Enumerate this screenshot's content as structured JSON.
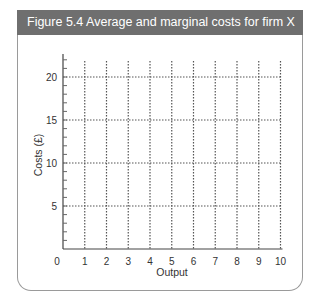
{
  "figure": {
    "title": "Figure 5.4  Average and marginal costs for firm X",
    "header_color": "#6f6f6f"
  },
  "chart_data": {
    "type": "line",
    "title": "Figure 5.4  Average and marginal costs for firm X",
    "xlabel": "Output",
    "ylabel": "Costs (£)",
    "x_ticks": [
      "0",
      "1",
      "2",
      "3",
      "4",
      "5",
      "6",
      "7",
      "8",
      "9",
      "10"
    ],
    "y_ticks": [
      "5",
      "10",
      "15",
      "20"
    ],
    "origin_label": "0",
    "xlim": [
      0,
      10
    ],
    "ylim": [
      0,
      22.5
    ],
    "grid": true,
    "grid_style": "dotted",
    "x_gridlines": [
      1,
      2,
      3,
      4,
      5,
      6,
      7,
      8,
      9,
      10
    ],
    "y_gridlines": [
      5,
      10,
      15,
      20
    ],
    "y_minor_ticks_every": 1,
    "series": []
  }
}
